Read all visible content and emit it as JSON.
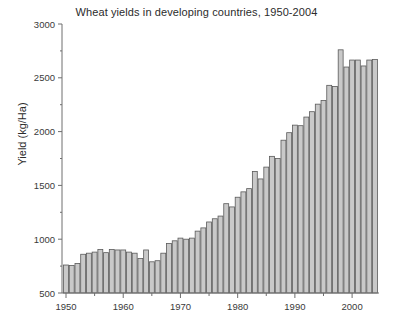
{
  "chart_data": {
    "type": "bar",
    "title": "Wheat yields in developing countries, 1950-2004",
    "xlabel": "",
    "ylabel": "Yield (kg/Ha)",
    "xlim": [
      1949.3,
      2004.7
    ],
    "ylim": [
      500,
      3000
    ],
    "grid": false,
    "legend": null,
    "ytick_labels": [
      "500",
      "1000",
      "1500",
      "2000",
      "2500",
      "3000"
    ],
    "ytick_values": [
      500,
      1000,
      1500,
      2000,
      2500,
      3000
    ],
    "yminor_step": 250,
    "xtick_labels": [
      "1950",
      "1960",
      "1970",
      "1980",
      "1990",
      "2000"
    ],
    "xtick_values": [
      1950,
      1960,
      1970,
      1980,
      1990,
      2000
    ],
    "xminor_step": 5,
    "bar_face_color": "#c9c9c9",
    "bar_edge_color": "#5a5a5a",
    "axis_color": "#6e6e6e",
    "text_color": "#3a3a3a",
    "categories": [
      1950,
      1951,
      1952,
      1953,
      1954,
      1955,
      1956,
      1957,
      1958,
      1959,
      1960,
      1961,
      1962,
      1963,
      1964,
      1965,
      1966,
      1967,
      1968,
      1969,
      1970,
      1971,
      1972,
      1973,
      1974,
      1975,
      1976,
      1977,
      1978,
      1979,
      1980,
      1981,
      1982,
      1983,
      1984,
      1985,
      1986,
      1987,
      1988,
      1989,
      1990,
      1991,
      1992,
      1993,
      1994,
      1995,
      1996,
      1997,
      1998,
      1999,
      2000,
      2001,
      2002,
      2003,
      2004
    ],
    "values": [
      760,
      755,
      775,
      860,
      870,
      880,
      905,
      875,
      905,
      900,
      900,
      880,
      870,
      820,
      900,
      790,
      800,
      870,
      960,
      985,
      1010,
      1000,
      1010,
      1075,
      1105,
      1160,
      1190,
      1215,
      1330,
      1300,
      1390,
      1440,
      1470,
      1630,
      1560,
      1670,
      1770,
      1750,
      1920,
      1990,
      2060,
      2055,
      2135,
      2185,
      2255,
      2290,
      2430,
      2420,
      2760,
      2600,
      2665,
      2665,
      2610,
      2665,
      2670
    ]
  }
}
